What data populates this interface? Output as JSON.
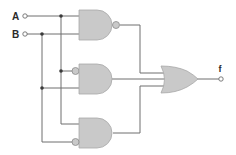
{
  "diagram": {
    "type": "logic-circuit",
    "inputs": [
      {
        "label": "A",
        "x": 24,
        "y": 16
      },
      {
        "label": "B",
        "x": 24,
        "y": 34
      }
    ],
    "output": {
      "label": "f",
      "x": 221,
      "y": 79
    },
    "gates": [
      {
        "id": "gate1",
        "type": "NAND",
        "inputs": [
          "A",
          "B"
        ]
      },
      {
        "id": "gate2",
        "type": "AND",
        "inputs": [
          "NOT A",
          "B"
        ]
      },
      {
        "id": "gate3",
        "type": "AND",
        "inputs": [
          "A",
          "NOT B"
        ]
      },
      {
        "id": "gate4",
        "type": "OR",
        "inputs": [
          "gate1",
          "gate2",
          "gate3"
        ],
        "output": "f"
      }
    ],
    "colors": {
      "gate_fill": "#c9c9c9",
      "wire": "#6e6e6e",
      "junction": "#3a3a3a"
    }
  }
}
